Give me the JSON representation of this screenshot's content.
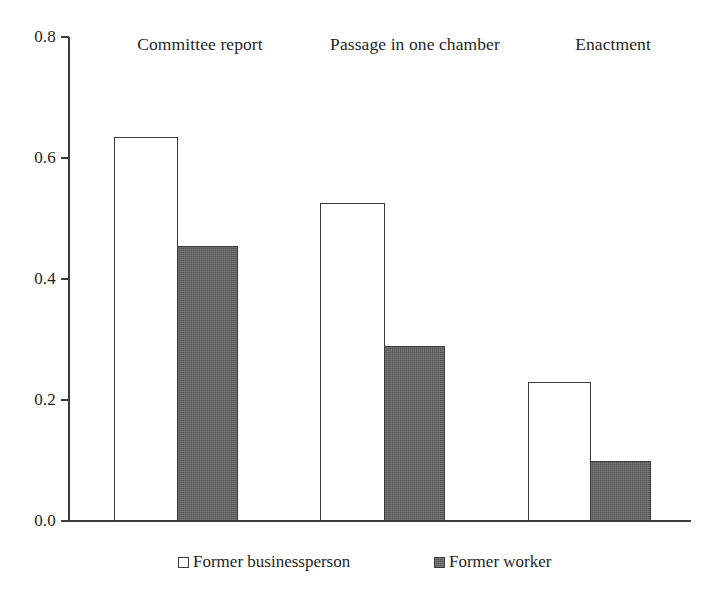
{
  "chart_data": {
    "type": "bar",
    "title": "",
    "xlabel": "",
    "ylabel": "",
    "ylim": [
      0.0,
      0.8
    ],
    "yticks": [
      "0.0",
      "0.2",
      "0.4",
      "0.6",
      "0.8"
    ],
    "ytick_values": [
      0.0,
      0.2,
      0.4,
      0.6,
      0.8
    ],
    "grid": false,
    "legend_position": "bottom",
    "categories": [
      "Committee report",
      "Passage in one chamber",
      "Enactment"
    ],
    "series": [
      {
        "name": "Former businessperson",
        "style": "hollow",
        "color": "#ffffff",
        "edge_color": "#3a3a3a",
        "values": [
          0.635,
          0.525,
          0.23
        ]
      },
      {
        "name": "Former worker",
        "style": "filled",
        "color": "#585858",
        "edge_color": "#3a3a3a",
        "values": [
          0.455,
          0.29,
          0.1
        ]
      }
    ]
  },
  "axis": {
    "y_min_label": "0.0",
    "y_max_label": "0.8"
  },
  "legend": {
    "entries": [
      {
        "label": "Former businessperson",
        "style": "light"
      },
      {
        "label": "Former worker",
        "style": "dark"
      }
    ]
  }
}
